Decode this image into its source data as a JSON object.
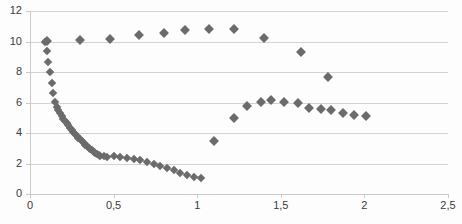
{
  "chart_data": {
    "type": "scatter",
    "title": "",
    "subtitle": "",
    "xlabel": "",
    "ylabel": "",
    "xlim": [
      0,
      2.5
    ],
    "ylim": [
      0,
      12
    ],
    "grid": true,
    "grid_axis": "y",
    "legend": false,
    "legend_position": "none",
    "marker": "diamond",
    "marker_color": "#6b6b6b",
    "decimal_separator": ",",
    "x_ticks": [
      0,
      0.5,
      1,
      1.5,
      2,
      2.5
    ],
    "x_tick_labels": [
      "0",
      "0,5",
      "1",
      "1,5",
      "2",
      "2,5"
    ],
    "y_ticks": [
      0,
      2,
      4,
      6,
      8,
      10,
      12
    ],
    "y_tick_labels": [
      "0",
      "2",
      "4",
      "6",
      "8",
      "10",
      "12"
    ],
    "series": [
      {
        "name": "upper-branch",
        "points": [
          [
            0.1,
            10.05
          ],
          [
            0.3,
            10.1
          ],
          [
            0.48,
            10.18
          ],
          [
            0.65,
            10.4
          ],
          [
            0.8,
            10.55
          ],
          [
            0.93,
            10.75
          ],
          [
            1.07,
            10.85
          ],
          [
            1.22,
            10.8
          ],
          [
            1.4,
            10.2
          ],
          [
            1.62,
            9.3
          ],
          [
            1.78,
            7.65
          ]
        ]
      },
      {
        "name": "descending-branch",
        "points": [
          [
            0.09,
            10.0
          ],
          [
            0.1,
            9.35
          ],
          [
            0.11,
            8.65
          ],
          [
            0.12,
            8.0
          ],
          [
            0.13,
            7.25
          ],
          [
            0.14,
            6.6
          ],
          [
            0.15,
            6.05
          ],
          [
            0.16,
            5.7
          ],
          [
            0.17,
            5.5
          ],
          [
            0.18,
            5.3
          ],
          [
            0.19,
            5.12
          ],
          [
            0.2,
            4.95
          ],
          [
            0.21,
            4.8
          ],
          [
            0.22,
            4.65
          ],
          [
            0.23,
            4.5
          ],
          [
            0.24,
            4.35
          ],
          [
            0.25,
            4.2
          ],
          [
            0.26,
            4.08
          ],
          [
            0.27,
            3.95
          ],
          [
            0.28,
            3.82
          ],
          [
            0.29,
            3.7
          ],
          [
            0.3,
            3.58
          ],
          [
            0.31,
            3.46
          ],
          [
            0.32,
            3.35
          ],
          [
            0.33,
            3.24
          ],
          [
            0.34,
            3.14
          ],
          [
            0.35,
            3.04
          ],
          [
            0.36,
            2.95
          ],
          [
            0.37,
            2.86
          ],
          [
            0.38,
            2.78
          ],
          [
            0.39,
            2.7
          ],
          [
            0.4,
            2.63
          ],
          [
            0.41,
            2.57
          ],
          [
            0.42,
            2.52
          ],
          [
            0.44,
            2.48
          ],
          [
            0.46,
            2.45
          ],
          [
            0.5,
            2.48
          ],
          [
            0.54,
            2.45
          ],
          [
            0.58,
            2.38
          ],
          [
            0.62,
            2.3
          ],
          [
            0.66,
            2.2
          ],
          [
            0.7,
            2.1
          ],
          [
            0.74,
            1.98
          ],
          [
            0.78,
            1.85
          ],
          [
            0.82,
            1.7
          ],
          [
            0.86,
            1.55
          ],
          [
            0.9,
            1.4
          ],
          [
            0.94,
            1.25
          ],
          [
            0.98,
            1.1
          ],
          [
            1.02,
            1.05
          ]
        ]
      },
      {
        "name": "lower-right-branch",
        "points": [
          [
            1.1,
            3.45
          ],
          [
            1.22,
            5.0
          ],
          [
            1.3,
            5.8
          ],
          [
            1.38,
            6.05
          ],
          [
            1.44,
            6.15
          ],
          [
            1.52,
            6.05
          ],
          [
            1.6,
            6.0
          ],
          [
            1.67,
            5.65
          ],
          [
            1.74,
            5.6
          ],
          [
            1.8,
            5.5
          ],
          [
            1.87,
            5.3
          ],
          [
            1.94,
            5.2
          ],
          [
            2.01,
            5.1
          ]
        ]
      }
    ]
  }
}
